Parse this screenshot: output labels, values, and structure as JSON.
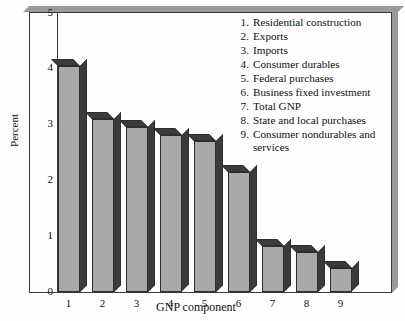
{
  "chart_data": {
    "type": "bar",
    "title": "",
    "xlabel": "GNP component",
    "ylabel": "Percent",
    "categories": [
      "1",
      "2",
      "3",
      "4",
      "5",
      "6",
      "7",
      "8",
      "9"
    ],
    "values": [
      4.05,
      3.1,
      2.95,
      2.8,
      2.7,
      2.15,
      0.82,
      0.72,
      0.42
    ],
    "ylim": [
      0,
      5
    ],
    "yticks": [
      0,
      1,
      2,
      3,
      4,
      5
    ],
    "ytick_labels": [
      "0",
      "1",
      "2",
      "3",
      "4",
      "5"
    ],
    "xtick_labels": [
      "1",
      "2",
      "3",
      "4",
      "5",
      "6",
      "7",
      "8",
      "9"
    ],
    "grid": false,
    "legend_position": "top-right",
    "style": "3d-bars",
    "colors": {
      "bar_front": "#a9a9a9",
      "bar_side": "#3b3b3b",
      "bar_top": "#3b3b3b",
      "bar_edge": "#2e2e2e",
      "axis": "#3a3a3a",
      "frame_shadow": "#9a9a9a",
      "background": "#fefefe",
      "text": "#111111"
    },
    "legend": [
      {
        "num": "1.",
        "label": "Residential construction"
      },
      {
        "num": "2.",
        "label": "Exports"
      },
      {
        "num": "3.",
        "label": "Imports"
      },
      {
        "num": "4.",
        "label": "Consumer durables"
      },
      {
        "num": "5.",
        "label": "Federal purchases"
      },
      {
        "num": "6.",
        "label": "Business fixed investment"
      },
      {
        "num": "7.",
        "label": "Total GNP"
      },
      {
        "num": "8.",
        "label": "State and local purchases"
      },
      {
        "num": "9.",
        "label": "Consumer nondurables and services"
      }
    ]
  }
}
